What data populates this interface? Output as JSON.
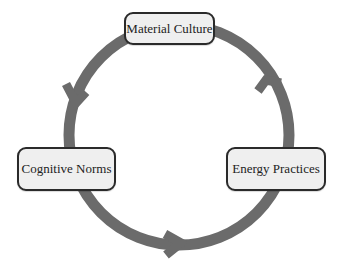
{
  "diagram": {
    "type": "cycle",
    "ring_color": "#6b6b6b",
    "node_fill": "#efefef",
    "node_border": "#2a2a2a",
    "nodes": [
      {
        "id": "material",
        "label": "Material Culture",
        "position": "top"
      },
      {
        "id": "energy",
        "label": "Energy Practices",
        "position": "right"
      },
      {
        "id": "cognitive",
        "label": "Cognitive Norms",
        "position": "left"
      }
    ],
    "edges": [
      {
        "from": "Material Culture",
        "to": "Cognitive Norms",
        "direction": "counter-clockwise"
      },
      {
        "from": "Cognitive Norms",
        "to": "Energy Practices",
        "direction": "counter-clockwise"
      },
      {
        "from": "Energy Practices",
        "to": "Material Culture",
        "direction": "counter-clockwise"
      }
    ]
  }
}
